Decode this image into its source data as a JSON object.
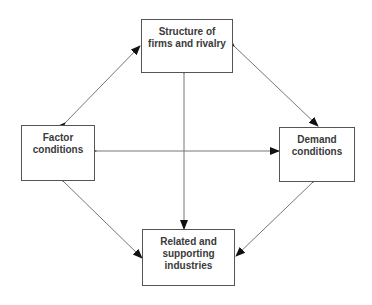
{
  "diagram": {
    "colors": {
      "background": "#ffffff",
      "box_border": "#555555",
      "text": "#3a3a3a",
      "arrow": "#777777",
      "arrowhead": "#111111"
    },
    "nodes": {
      "top": {
        "lines": [
          "Structure of",
          "firms and rivalry"
        ]
      },
      "left": {
        "lines": [
          "Factor",
          "conditions"
        ]
      },
      "right": {
        "lines": [
          "Demand",
          "conditions"
        ]
      },
      "bottom": {
        "lines": [
          "Related and",
          "supporting",
          "industries"
        ]
      }
    },
    "edges": [
      {
        "from": "left",
        "to": "top",
        "type": "bidirectional"
      },
      {
        "from": "top",
        "to": "right",
        "type": "bidirectional"
      },
      {
        "from": "left",
        "to": "bottom",
        "type": "bidirectional"
      },
      {
        "from": "right",
        "to": "bottom",
        "type": "bidirectional"
      },
      {
        "from": "left",
        "to": "right",
        "type": "bidirectional"
      },
      {
        "from": "top",
        "to": "bottom",
        "type": "bidirectional"
      }
    ]
  }
}
